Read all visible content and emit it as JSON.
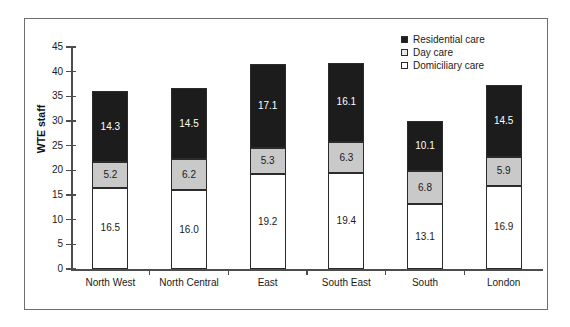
{
  "chart_data": {
    "type": "bar",
    "stacked": true,
    "title": "",
    "xlabel": "",
    "ylabel": "WTE staff",
    "ylim": [
      0,
      45
    ],
    "yticks": [
      0,
      5,
      10,
      15,
      20,
      25,
      30,
      35,
      40,
      45
    ],
    "grid": false,
    "legend_position": "top-right",
    "categories": [
      "North West",
      "North Central",
      "East",
      "South East",
      "South",
      "London"
    ],
    "series": [
      {
        "name": "Domiciliary care",
        "color": "#ffffff",
        "values": [
          16.5,
          16.0,
          19.2,
          19.4,
          13.1,
          16.9
        ]
      },
      {
        "name": "Day care",
        "color": "#c9c9c9",
        "values": [
          5.2,
          6.2,
          5.3,
          6.3,
          6.8,
          5.9
        ]
      },
      {
        "name": "Residential care",
        "color": "#1c1c1c",
        "values": [
          14.3,
          14.5,
          17.1,
          16.1,
          10.1,
          14.5
        ]
      }
    ],
    "totals": [
      36.0,
      36.7,
      41.6,
      41.8,
      30.0,
      37.3
    ],
    "legend": [
      {
        "label": "Residential care",
        "swatch": "black"
      },
      {
        "label": "Day care",
        "swatch": "gray"
      },
      {
        "label": "Domiciliary care",
        "swatch": "white"
      }
    ]
  }
}
